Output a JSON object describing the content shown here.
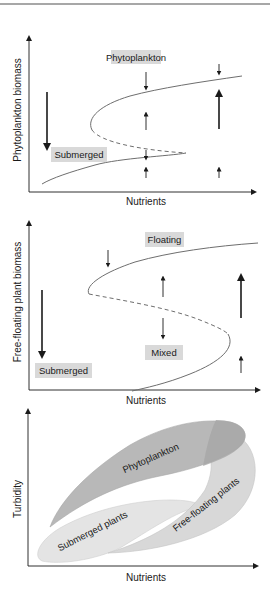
{
  "colors": {
    "axis": "#1a1a1a",
    "curve": "#6e6e6e",
    "label_box": "#d9d9d9",
    "phytoplankton_region": "#b9b9b9",
    "submerged_region": "#e4e4e4",
    "floating_region": "#d2d2d2",
    "top_rule": "#8a8a8a"
  },
  "panel1": {
    "y_label": "Phytoplankton biomass",
    "x_label": "Nutrients",
    "state_labels": {
      "upper": "Phytoplankton",
      "lower": "Submerged"
    }
  },
  "panel2": {
    "y_label": "Free-floating plant biomass",
    "x_label": "Nutrients",
    "state_labels": {
      "upper": "Floating",
      "middle": "Mixed",
      "lower": "Submerged"
    }
  },
  "panel3": {
    "y_label": "Turbidity",
    "x_label": "Nutrients",
    "regions": {
      "phytoplankton": "Phytoplankton",
      "submerged": "Submerged plants",
      "floating": "Free-floating plants"
    }
  }
}
